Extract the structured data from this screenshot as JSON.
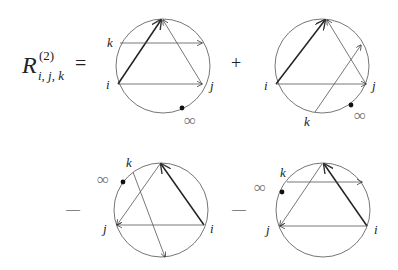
{
  "formula": {
    "lhs_symbol": "R",
    "lhs_superscript": "(2)",
    "lhs_subscript": "i, j, k",
    "equals": "=",
    "operators": [
      "+",
      "—",
      "—"
    ]
  },
  "diagrams": [
    {
      "name": "term-1",
      "sign": "",
      "labels": {
        "i": "i",
        "j": "j",
        "k": "k",
        "infinity": "∞"
      }
    },
    {
      "name": "term-2",
      "sign": "+",
      "labels": {
        "i": "i",
        "j": "j",
        "k": "k",
        "infinity": "∞"
      }
    },
    {
      "name": "term-3",
      "sign": "—",
      "labels": {
        "i": "i",
        "j": "j",
        "k": "k",
        "infinity": "∞"
      }
    },
    {
      "name": "term-4",
      "sign": "—",
      "labels": {
        "i": "i",
        "j": "j",
        "k": "k",
        "infinity": "∞"
      }
    }
  ],
  "colors": {
    "ink": "#222222",
    "circle": "#666666",
    "infinity": "#777777"
  }
}
